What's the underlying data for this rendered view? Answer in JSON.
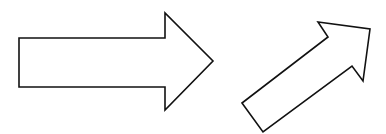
{
  "canvas": {
    "width": 386,
    "height": 134,
    "background": "#ffffff"
  },
  "stroke": {
    "color": "#111111",
    "width": 1.6
  },
  "fill": "#ffffff",
  "shapes": [
    {
      "id": "right-arrow",
      "direction": "right",
      "points": "19,38 165,38 165,13 213,61 165,110 165,87 19,87"
    },
    {
      "id": "diagonal-arrow",
      "direction": "up-right",
      "points": "242,103 263,132 352,66 363,81 370,29 318,22 328,37"
    }
  ]
}
